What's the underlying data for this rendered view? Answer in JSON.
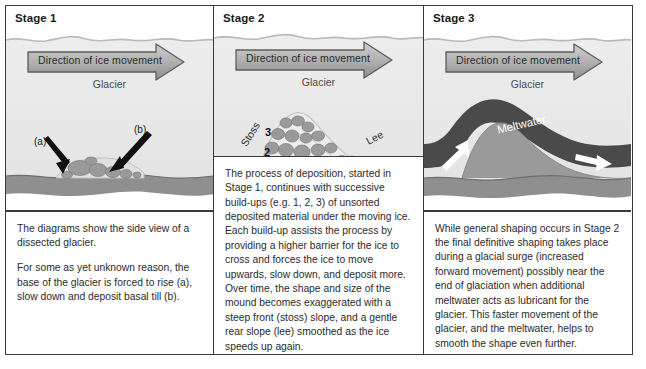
{
  "figure": {
    "panels": [
      {
        "title": "Stage 1",
        "arrow_label": "Direction of ice movement",
        "glacier_label": "Glacier",
        "annotations": {
          "a": "(a)",
          "b": "(b)"
        },
        "caption": [
          "The diagrams show the side view of a dissected glacier.",
          "For some as yet unknown reason, the base of the glacier is forced to rise (a), slow down and deposit basal till (b)."
        ]
      },
      {
        "title": "Stage 2",
        "arrow_label": "Direction of ice movement",
        "glacier_label": "Glacier",
        "annotations": {
          "stoss": "Stoss",
          "lee": "Lee",
          "layer_1": "1",
          "layer_2": "2",
          "layer_3": "3"
        },
        "caption": [
          "The process of deposition, started in Stage 1, continues with successive build-ups (e.g. 1, 2, 3) of unsorted deposited material under the moving ice. Each build-up assists the process by providing a higher barrier for the ice to cross and forces the ice to move upwards, slow down, and deposit more. Over time, the shape and size of the mound becomes exaggerated with a steep front (stoss) slope, and a gentle rear slope (lee) smoothed as the ice speeds up again."
        ]
      },
      {
        "title": "Stage 3",
        "arrow_label": "Direction of ice movement",
        "glacier_label": "Glacier",
        "annotations": {
          "meltwater": "Meltwater"
        },
        "caption": [
          "While general shaping occurs in Stage 2 the final definitive shaping takes place during a glacial surge (increased forward movement) possibly near the end of glaciation when additional meltwater acts as lubricant for the glacier. This faster movement of the glacier, and the meltwater, helps to smooth the shape even further."
        ]
      }
    ],
    "colors": {
      "border": "#3a3a3a",
      "glacier_ice": "#e9e9e9",
      "bedrock": "#8f8f8f",
      "till_boulder": "#9a9a9a",
      "meltwater": "#4a4a4a",
      "mound": "#9a9a9a",
      "arrow_fill": "#a8a8a8"
    }
  }
}
